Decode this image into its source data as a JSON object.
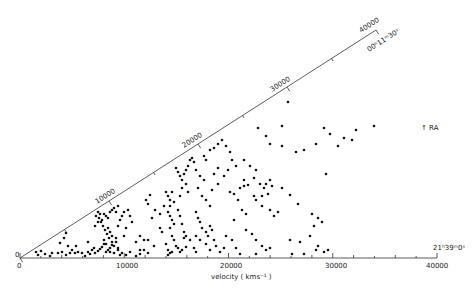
{
  "chart_data": {
    "type": "scatter",
    "title": "",
    "subtitle": "Wedge (pie) diagram of galaxy redshifts",
    "xlabel": "velocity  ( kms⁻¹ )",
    "ylabel": "",
    "xlim": [
      0,
      40000
    ],
    "radial_ticks": [
      "0",
      "10000",
      "20000",
      "30000",
      "40000"
    ],
    "diagonal_ticks": [
      "0",
      "10000",
      "20000",
      "30000",
      "40000"
    ],
    "annotations": {
      "ra_bottom": "21ʰ39ᵐ0ˢ",
      "ra_top": "00ʰ11ᵐ30ˢ",
      "ra_arrow": "↑ RA",
      "origin_bottom": "0",
      "origin_diag": "0"
    },
    "grid": false,
    "legend": null,
    "geometry": {
      "origin_px": [
        20,
        258
      ],
      "bottom_end_px": [
        437,
        258
      ],
      "diag_end_px": [
        376,
        30
      ]
    },
    "points_px": [
      [
        36,
        252
      ],
      [
        38,
        255
      ],
      [
        41,
        251
      ],
      [
        45,
        254
      ],
      [
        50,
        256
      ],
      [
        52,
        253
      ],
      [
        58,
        253
      ],
      [
        62,
        252
      ],
      [
        66,
        255
      ],
      [
        70,
        253
      ],
      [
        72,
        250
      ],
      [
        75,
        253
      ],
      [
        78,
        252
      ],
      [
        82,
        253
      ],
      [
        85,
        256
      ],
      [
        88,
        252
      ],
      [
        90,
        254
      ],
      [
        92,
        250
      ],
      [
        95,
        253
      ],
      [
        98,
        251
      ],
      [
        100,
        249
      ],
      [
        102,
        247
      ],
      [
        104,
        244
      ],
      [
        106,
        252
      ],
      [
        108,
        250
      ],
      [
        110,
        248
      ],
      [
        112,
        245
      ],
      [
        114,
        253
      ],
      [
        116,
        242
      ],
      [
        118,
        250
      ],
      [
        122,
        253
      ],
      [
        126,
        255
      ],
      [
        130,
        252
      ],
      [
        136,
        256
      ],
      [
        140,
        254
      ],
      [
        144,
        250
      ],
      [
        148,
        253
      ],
      [
        168,
        255
      ],
      [
        170,
        253
      ],
      [
        172,
        252
      ],
      [
        178,
        248
      ],
      [
        182,
        250
      ],
      [
        186,
        247
      ],
      [
        184,
        238
      ],
      [
        120,
        255
      ],
      [
        60,
        243
      ],
      [
        64,
        238
      ],
      [
        68,
        246
      ],
      [
        76,
        246
      ],
      [
        88,
        242
      ],
      [
        94,
        248
      ],
      [
        66,
        233
      ],
      [
        96,
        216
      ],
      [
        98,
        212
      ],
      [
        100,
        214
      ],
      [
        99,
        218
      ],
      [
        102,
        220
      ],
      [
        104,
        214
      ],
      [
        101,
        222
      ],
      [
        106,
        216
      ],
      [
        108,
        218
      ],
      [
        110,
        212
      ],
      [
        112,
        210
      ],
      [
        114,
        208
      ],
      [
        116,
        212
      ],
      [
        118,
        206
      ],
      [
        103,
        226
      ],
      [
        105,
        230
      ],
      [
        107,
        234
      ],
      [
        109,
        238
      ],
      [
        104,
        240
      ],
      [
        106,
        244
      ],
      [
        108,
        228
      ],
      [
        110,
        232
      ],
      [
        98,
        222
      ],
      [
        95,
        226
      ],
      [
        112,
        236
      ],
      [
        116,
        238
      ],
      [
        112,
        242
      ],
      [
        114,
        246
      ],
      [
        120,
        220
      ],
      [
        122,
        216
      ],
      [
        124,
        212
      ],
      [
        128,
        210
      ],
      [
        130,
        216
      ],
      [
        132,
        222
      ],
      [
        126,
        228
      ],
      [
        124,
        236
      ],
      [
        118,
        226
      ],
      [
        118,
        248
      ],
      [
        110,
        252
      ],
      [
        146,
        200
      ],
      [
        148,
        204
      ],
      [
        150,
        195
      ],
      [
        155,
        210
      ],
      [
        152,
        218
      ],
      [
        160,
        214
      ],
      [
        164,
        206
      ],
      [
        160,
        228
      ],
      [
        162,
        232
      ],
      [
        140,
        236
      ],
      [
        144,
        240
      ],
      [
        140,
        250
      ],
      [
        136,
        242
      ],
      [
        148,
        240
      ],
      [
        154,
        246
      ],
      [
        166,
        192
      ],
      [
        168,
        196
      ],
      [
        170,
        200
      ],
      [
        172,
        192
      ],
      [
        174,
        202
      ],
      [
        170,
        206
      ],
      [
        168,
        212
      ],
      [
        170,
        216
      ],
      [
        172,
        220
      ],
      [
        174,
        224
      ],
      [
        170,
        228
      ],
      [
        172,
        236
      ],
      [
        174,
        240
      ],
      [
        176,
        246
      ],
      [
        166,
        244
      ],
      [
        168,
        250
      ],
      [
        178,
        210
      ],
      [
        180,
        196
      ],
      [
        180,
        216
      ],
      [
        182,
        224
      ],
      [
        184,
        232
      ],
      [
        186,
        236
      ],
      [
        190,
        240
      ],
      [
        194,
        248
      ],
      [
        196,
        252
      ],
      [
        180,
        252
      ],
      [
        176,
        168
      ],
      [
        178,
        172
      ],
      [
        180,
        176
      ],
      [
        182,
        180
      ],
      [
        184,
        174
      ],
      [
        186,
        170
      ],
      [
        188,
        166
      ],
      [
        190,
        160
      ],
      [
        192,
        158
      ],
      [
        194,
        162
      ],
      [
        182,
        188
      ],
      [
        186,
        184
      ],
      [
        188,
        192
      ],
      [
        196,
        170
      ],
      [
        200,
        176
      ],
      [
        204,
        180
      ],
      [
        198,
        188
      ],
      [
        202,
        196
      ],
      [
        206,
        200
      ],
      [
        210,
        206
      ],
      [
        212,
        190
      ],
      [
        214,
        174
      ],
      [
        218,
        168
      ],
      [
        196,
        212
      ],
      [
        198,
        218
      ],
      [
        200,
        222
      ],
      [
        202,
        228
      ],
      [
        206,
        232
      ],
      [
        208,
        236
      ],
      [
        210,
        226
      ],
      [
        212,
        230
      ],
      [
        214,
        240
      ],
      [
        216,
        246
      ],
      [
        206,
        244
      ],
      [
        200,
        240
      ],
      [
        196,
        236
      ],
      [
        210,
        250
      ],
      [
        220,
        252
      ],
      [
        224,
        248
      ],
      [
        230,
        192
      ],
      [
        234,
        194
      ],
      [
        238,
        200
      ],
      [
        240,
        188
      ],
      [
        244,
        186
      ],
      [
        242,
        210
      ],
      [
        246,
        214
      ],
      [
        234,
        220
      ],
      [
        226,
        236
      ],
      [
        232,
        240
      ],
      [
        236,
        248
      ],
      [
        240,
        254
      ],
      [
        204,
        156
      ],
      [
        206,
        160
      ],
      [
        210,
        150
      ],
      [
        214,
        148
      ],
      [
        218,
        144
      ],
      [
        222,
        140
      ],
      [
        226,
        146
      ],
      [
        230,
        152
      ],
      [
        232,
        160
      ],
      [
        236,
        166
      ],
      [
        228,
        170
      ],
      [
        224,
        176
      ],
      [
        218,
        184
      ],
      [
        244,
        160
      ],
      [
        250,
        166
      ],
      [
        256,
        170
      ],
      [
        254,
        178
      ],
      [
        260,
        184
      ],
      [
        264,
        188
      ],
      [
        266,
        184
      ],
      [
        270,
        180
      ],
      [
        272,
        186
      ],
      [
        268,
        194
      ],
      [
        262,
        196
      ],
      [
        256,
        200
      ],
      [
        262,
        206
      ],
      [
        270,
        210
      ],
      [
        274,
        216
      ],
      [
        278,
        212
      ],
      [
        246,
        230
      ],
      [
        252,
        234
      ],
      [
        256,
        240
      ],
      [
        262,
        246
      ],
      [
        266,
        250
      ],
      [
        270,
        248
      ],
      [
        256,
        254
      ],
      [
        258,
        128
      ],
      [
        282,
        126
      ],
      [
        288,
        102
      ],
      [
        266,
        136
      ],
      [
        270,
        144
      ],
      [
        282,
        146
      ],
      [
        296,
        152
      ],
      [
        304,
        150
      ],
      [
        316,
        144
      ],
      [
        324,
        128
      ],
      [
        330,
        134
      ],
      [
        338,
        146
      ],
      [
        344,
        138
      ],
      [
        352,
        140
      ],
      [
        356,
        130
      ],
      [
        374,
        126
      ],
      [
        326,
        174
      ],
      [
        244,
        180
      ],
      [
        248,
        185
      ],
      [
        254,
        196
      ],
      [
        282,
        188
      ],
      [
        290,
        195
      ],
      [
        298,
        204
      ],
      [
        312,
        214
      ],
      [
        318,
        218
      ],
      [
        322,
        222
      ],
      [
        314,
        226
      ],
      [
        310,
        236
      ],
      [
        318,
        246
      ],
      [
        316,
        250
      ],
      [
        324,
        252
      ],
      [
        328,
        250
      ],
      [
        300,
        242
      ],
      [
        304,
        254
      ],
      [
        292,
        254
      ],
      [
        290,
        240
      ]
    ]
  }
}
